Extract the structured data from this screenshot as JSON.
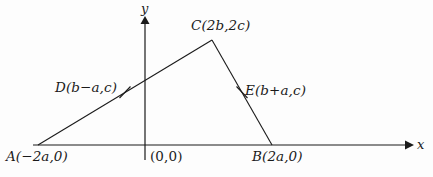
{
  "figure": {
    "kind": "coordinate-geometry-triangle",
    "background_color": "#fdfdfd",
    "stroke_color": "#1a1a1a"
  },
  "axes": {
    "x_label": "x",
    "y_label": "y",
    "origin_label": "(0,0)",
    "x_axis": {
      "x1": 33,
      "y1": 145,
      "x2": 410,
      "y2": 145,
      "arrow": "right"
    },
    "y_axis": {
      "x1": 145,
      "y1": 160,
      "x2": 145,
      "y2": 17,
      "arrow": "up"
    }
  },
  "points": [
    {
      "id": "A",
      "label": "A(−2a,0)",
      "coord_text": "(−2a,0)",
      "px": 38,
      "py": 145
    },
    {
      "id": "B",
      "label": "B(2a,0)",
      "coord_text": "(2a,0)",
      "px": 272,
      "py": 145
    },
    {
      "id": "C",
      "label": "C(2b,2c)",
      "coord_text": "(2b,2c)",
      "px": 212,
      "py": 40
    },
    {
      "id": "D",
      "label": "D(b−a,c)",
      "coord_text": "(b−a,c)",
      "px": 125,
      "py": 92
    },
    {
      "id": "E",
      "label": "E(b+a,c)",
      "coord_text": "(b+a,c)",
      "px": 242,
      "py": 92
    }
  ],
  "segments": [
    {
      "id": "AC",
      "from": "A",
      "to": "C",
      "x1": 38,
      "y1": 145,
      "x2": 212,
      "y2": 40
    },
    {
      "id": "CB",
      "from": "C",
      "to": "B",
      "x1": 212,
      "y1": 40,
      "x2": 272,
      "y2": 145
    },
    {
      "id": "AB",
      "from": "A",
      "to": "B",
      "x1": 38,
      "y1": 145,
      "x2": 272,
      "y2": 145
    }
  ],
  "tick_marks": [
    {
      "id": "tick-D",
      "on_segment": "AC",
      "cx": 125,
      "cy": 92,
      "x1": 119,
      "y1": 98,
      "x2": 131,
      "y2": 86
    },
    {
      "id": "tick-E",
      "on_segment": "CB",
      "cx": 242,
      "cy": 92,
      "x1": 236,
      "y1": 86,
      "x2": 248,
      "y2": 98
    }
  ]
}
